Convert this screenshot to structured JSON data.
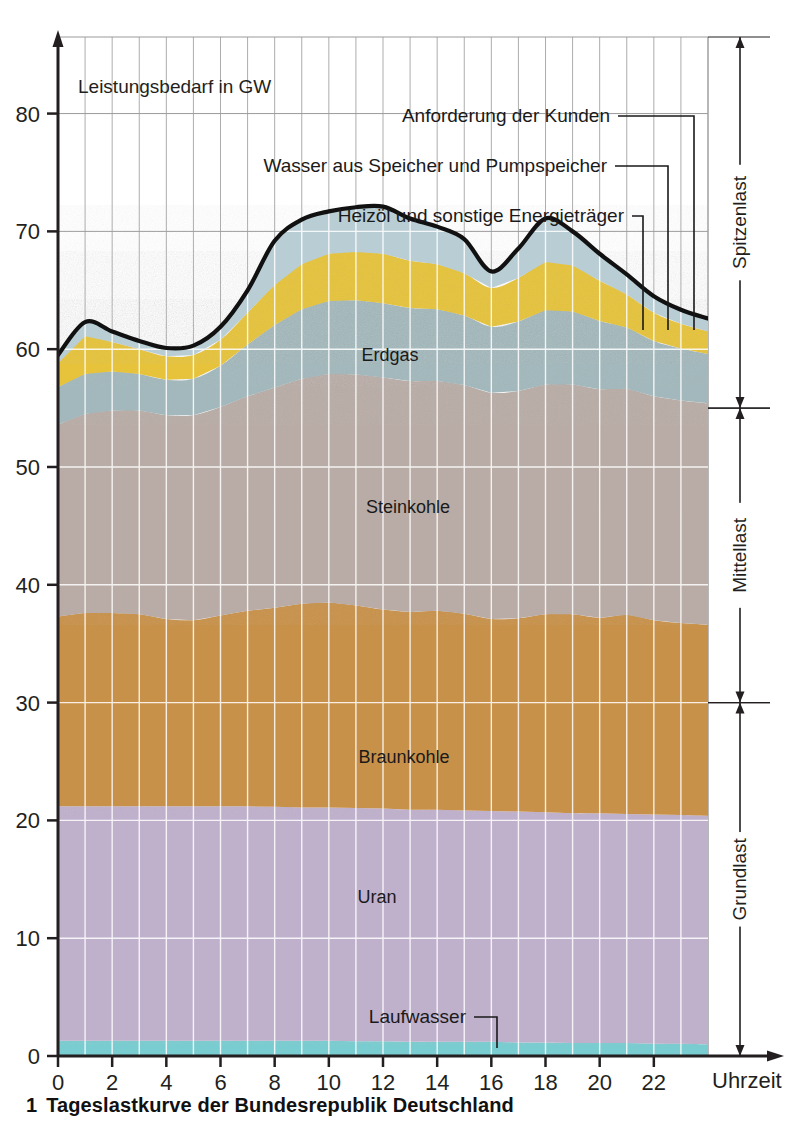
{
  "figure": {
    "caption_number": "1",
    "caption_text": "Tageslastkurve der Bundesrepublik Deutschland"
  },
  "axes": {
    "y_axis_title": "Leistungsbedarf in GW",
    "x_axis_title": "Uhrzeit",
    "y_ticks": [
      "0",
      "10",
      "20",
      "30",
      "40",
      "50",
      "60",
      "70",
      "80"
    ],
    "x_ticks": [
      "0",
      "2",
      "4",
      "6",
      "8",
      "10",
      "12",
      "14",
      "16",
      "18",
      "20",
      "22"
    ]
  },
  "callouts": [
    {
      "label": "Anforderung der Kunden"
    },
    {
      "label": "Wasser aus Speicher und Pumpspeicher"
    },
    {
      "label": "Heizöl und sonstige Energieträger"
    },
    {
      "label": "Laufwasser"
    }
  ],
  "brackets": [
    {
      "label": "Spitzenlast",
      "from": 55.0,
      "to": 86.5
    },
    {
      "label": "Mittellast",
      "from": 30.0,
      "to": 55.0
    },
    {
      "label": "Grundlast",
      "from": 0.0,
      "to": 30.0
    }
  ],
  "colors": {
    "laufwasser": "#79cdd0",
    "uran": "#bfb0cc",
    "braunkohle": "#c8914a",
    "steinkohle": "#b9aca6",
    "erdgas": "#a2b8bc",
    "heizoel": "#e6c33a",
    "wasser_speicher": "#b9cdd4",
    "curve": "#111111",
    "grid": "#9a9a9a",
    "grid_inner": "#f2f2f2",
    "axis": "#231f20"
  },
  "chart_data": {
    "type": "area",
    "title": "Tageslastkurve der Bundesrepublik Deutschland",
    "xlabel": "Uhrzeit",
    "ylabel": "Leistungsbedarf in GW",
    "xlim": [
      0,
      24
    ],
    "ylim": [
      0,
      86.5
    ],
    "grid": true,
    "legend": "in-plot labels",
    "stacking": "bottom-to-top",
    "x": [
      0,
      1,
      2,
      3,
      4,
      5,
      6,
      7,
      8,
      9,
      10,
      11,
      12,
      13,
      14,
      15,
      16,
      17,
      18,
      19,
      20,
      21,
      22,
      23,
      24
    ],
    "series": [
      {
        "name": "Laufwasser",
        "color": "#79cdd0",
        "values": [
          1.3,
          1.3,
          1.3,
          1.3,
          1.3,
          1.3,
          1.3,
          1.3,
          1.3,
          1.3,
          1.3,
          1.25,
          1.25,
          1.2,
          1.2,
          1.2,
          1.2,
          1.15,
          1.15,
          1.1,
          1.1,
          1.1,
          1.05,
          1.05,
          1.0
        ]
      },
      {
        "name": "Uran",
        "color": "#bfb0cc",
        "values": [
          19.9,
          19.9,
          19.9,
          19.9,
          19.9,
          19.9,
          19.9,
          19.9,
          19.85,
          19.8,
          19.8,
          19.8,
          19.75,
          19.7,
          19.7,
          19.65,
          19.6,
          19.6,
          19.55,
          19.5,
          19.5,
          19.45,
          19.45,
          19.4,
          19.4
        ]
      },
      {
        "name": "Braunkohle",
        "color": "#c8914a",
        "values": [
          16.1,
          16.4,
          16.4,
          16.3,
          15.9,
          15.8,
          16.2,
          16.6,
          16.9,
          17.3,
          17.4,
          17.2,
          16.9,
          16.8,
          16.9,
          16.7,
          16.3,
          16.4,
          16.8,
          16.9,
          16.6,
          16.9,
          16.5,
          16.3,
          16.2
        ]
      },
      {
        "name": "Steinkohle",
        "color": "#b9aca6",
        "values": [
          16.3,
          16.9,
          17.2,
          17.3,
          17.3,
          17.4,
          17.7,
          18.2,
          18.7,
          19.1,
          19.4,
          19.6,
          19.7,
          19.6,
          19.5,
          19.4,
          19.2,
          19.3,
          19.5,
          19.5,
          19.4,
          19.2,
          19.0,
          18.9,
          18.8
        ]
      },
      {
        "name": "Erdgas",
        "color": "#a2b8bc",
        "values": [
          3.2,
          3.4,
          3.3,
          3.1,
          3.0,
          3.1,
          3.5,
          4.4,
          5.3,
          5.9,
          6.2,
          6.3,
          6.3,
          6.2,
          6.1,
          5.9,
          5.6,
          5.9,
          6.3,
          6.2,
          5.8,
          5.2,
          4.7,
          4.4,
          4.2
        ]
      },
      {
        "name": "Heizöl und sonstige Energieträger",
        "color": "#e6c33a",
        "values": [
          2.0,
          3.2,
          2.5,
          2.1,
          2.0,
          2.0,
          2.2,
          2.7,
          3.4,
          3.8,
          4.0,
          4.1,
          4.2,
          4.0,
          3.8,
          3.6,
          3.3,
          3.7,
          4.1,
          3.9,
          3.4,
          2.8,
          2.4,
          2.1,
          1.9
        ]
      },
      {
        "name": "Wasser aus Speicher und Pumpspeicher",
        "color": "#b9cdd4",
        "values": [
          0.7,
          1.2,
          0.9,
          0.7,
          0.7,
          0.8,
          1.1,
          1.9,
          3.7,
          3.8,
          3.6,
          3.8,
          4.0,
          3.6,
          3.2,
          2.9,
          1.4,
          2.5,
          3.7,
          2.9,
          2.3,
          1.7,
          1.4,
          1.2,
          1.1
        ]
      }
    ],
    "total_curve": {
      "name": "Anforderung der Kunden",
      "color": "#111111",
      "values": [
        59.5,
        62.3,
        61.5,
        60.7,
        60.1,
        60.3,
        61.9,
        65.0,
        69.2,
        71.0,
        71.7,
        72.05,
        72.1,
        71.1,
        70.4,
        69.35,
        66.6,
        68.55,
        71.1,
        70.0,
        68.1,
        66.35,
        64.5,
        63.35,
        62.6
      ]
    }
  },
  "in_plot_labels": [
    {
      "text": "Erdgas"
    },
    {
      "text": "Steinkohle"
    },
    {
      "text": "Braunkohle"
    },
    {
      "text": "Uran"
    }
  ]
}
